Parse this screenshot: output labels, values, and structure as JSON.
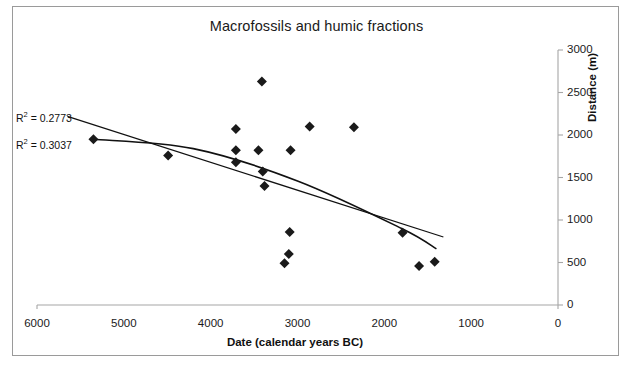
{
  "figure": {
    "border_color": "#9a9a9a",
    "background": "#ffffff"
  },
  "chart_data": {
    "type": "scatter",
    "title": "Macrofossils and humic fractions",
    "xlabel": "Date (calendar years BC)",
    "ylabel": "Distance  (m)",
    "xlim": [
      6000,
      0
    ],
    "ylim": [
      0,
      3000
    ],
    "x_reversed": true,
    "grid": false,
    "legend": null,
    "xticks": [
      6000,
      5000,
      4000,
      3000,
      2000,
      1000,
      0
    ],
    "xtick_labels": [
      "6000",
      "5000",
      "4000",
      "3000",
      "2000",
      "1000",
      "0"
    ],
    "yticks": [
      0,
      500,
      1000,
      1500,
      2000,
      2500,
      3000
    ],
    "ytick_labels": [
      "0",
      "500",
      "1000",
      "1500",
      "2000",
      "2500",
      "3000"
    ],
    "yaxis_position": "right",
    "marker": "diamond",
    "marker_color": "#1a1a1a",
    "points": [
      {
        "x": 5350,
        "y": 1950
      },
      {
        "x": 4490,
        "y": 1760
      },
      {
        "x": 3710,
        "y": 2070
      },
      {
        "x": 3710,
        "y": 1820
      },
      {
        "x": 3710,
        "y": 1680
      },
      {
        "x": 3450,
        "y": 1820
      },
      {
        "x": 3410,
        "y": 2630
      },
      {
        "x": 3400,
        "y": 1570
      },
      {
        "x": 3380,
        "y": 1400
      },
      {
        "x": 3150,
        "y": 490
      },
      {
        "x": 3100,
        "y": 600
      },
      {
        "x": 3090,
        "y": 860
      },
      {
        "x": 3080,
        "y": 1820
      },
      {
        "x": 2860,
        "y": 2100
      },
      {
        "x": 2350,
        "y": 2090
      },
      {
        "x": 1790,
        "y": 850
      },
      {
        "x": 1600,
        "y": 460
      },
      {
        "x": 1420,
        "y": 510
      }
    ],
    "trendlines": [
      {
        "name": "linear-trendline",
        "fit": "linear",
        "r_squared": 0.2773,
        "label": "R² = 0.2773",
        "endpoints": [
          {
            "x": 5650,
            "y": 2220
          },
          {
            "x": 1320,
            "y": 800
          }
        ]
      },
      {
        "name": "polynomial-trendline",
        "fit": "polynomial",
        "r_squared": 0.3037,
        "label": "R² = 0.3037",
        "control_points": [
          {
            "x": 5350,
            "y": 1950
          },
          {
            "x": 4200,
            "y": 1840
          },
          {
            "x": 3000,
            "y": 1460
          },
          {
            "x": 1800,
            "y": 900
          },
          {
            "x": 1400,
            "y": 660
          }
        ]
      }
    ],
    "annotations": [
      {
        "name": "r2-linear-annotation",
        "text_prefix": "R",
        "text_sup": "2",
        "text_rest": " = 0.2773"
      },
      {
        "name": "r2-poly-annotation",
        "text_prefix": "R",
        "text_sup": "2",
        "text_rest": " = 0.3037"
      }
    ]
  }
}
